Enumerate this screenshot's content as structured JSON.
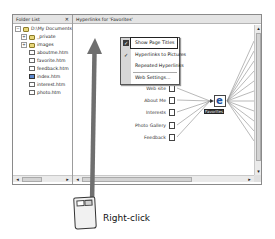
{
  "folder_list": {
    "title": "Folder List",
    "close_glyph": "✕",
    "root": "D:\\My Documents",
    "items": [
      {
        "label": "_private",
        "type": "folder",
        "expandable": true
      },
      {
        "label": "images",
        "type": "folder",
        "expandable": true
      },
      {
        "label": "aboutme.htm",
        "type": "page"
      },
      {
        "label": "favorite.htm",
        "type": "page"
      },
      {
        "label": "feedback.htm",
        "type": "page"
      },
      {
        "label": "index.htm",
        "type": "home-page"
      },
      {
        "label": "interest.htm",
        "type": "page"
      },
      {
        "label": "photo.htm",
        "type": "page"
      }
    ]
  },
  "hyperlinks_pane": {
    "title": "Hyperlinks for 'Favorites'",
    "center_node": "Favorites",
    "left_nodes": [
      "Web site",
      "About Me",
      "Interests",
      "Photo Gallery",
      "Feedback"
    ]
  },
  "context_menu": {
    "items": [
      {
        "label": "Show Page Titles",
        "checked": true,
        "highlighted": true
      },
      {
        "label": "Hyperlinks to Pictures",
        "checked": true
      },
      {
        "label": "Repeated Hyperlinks",
        "checked": false
      },
      {
        "label": "Web Settings...",
        "checked": false,
        "separator_before": true
      }
    ]
  },
  "scroll_glyphs": {
    "left": "◂",
    "right": "▸",
    "up": "▴",
    "down": "▾"
  },
  "annotation": {
    "caption": "Right-click",
    "arrow_color": "#6f6f6f"
  }
}
